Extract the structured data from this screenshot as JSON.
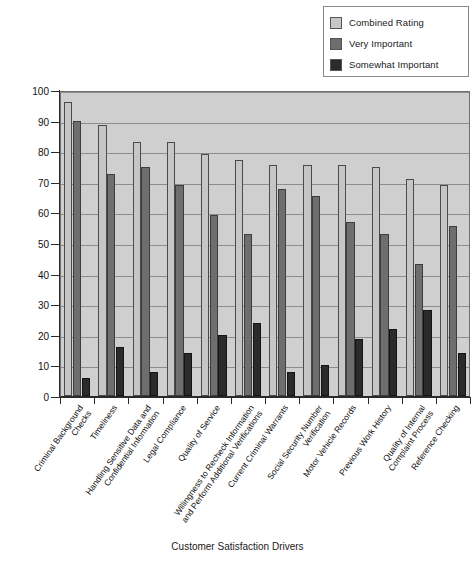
{
  "legend": {
    "position": "top-right",
    "items": [
      {
        "label": "Combined Rating",
        "color": "#c6c6c6",
        "swatch_name": "legend-swatch-combined-rating"
      },
      {
        "label": "Very Important",
        "color": "#6e6e6e",
        "swatch_name": "legend-swatch-very-important"
      },
      {
        "label": "Somewhat Important",
        "color": "#2b2b2b",
        "swatch_name": "legend-swatch-somewhat-important"
      }
    ]
  },
  "axes": {
    "y_ticks": [
      "100",
      "90",
      "80",
      "70",
      "60",
      "50",
      "40",
      "30",
      "20",
      "10",
      "0"
    ],
    "x_title": "Customer Satisfaction Drivers"
  },
  "chart_data": {
    "type": "bar",
    "title": "",
    "subtitle": "",
    "xlabel": "Customer Satisfaction Drivers",
    "ylabel": "",
    "ylim": [
      0,
      100
    ],
    "ytick_step": 10,
    "grid": true,
    "legend_position": "top-right",
    "plot_background": "#cfcfcf",
    "categories": [
      "Criminal Background Checks",
      "Timeliness",
      "Handling Sensitive Data and Confidential Information",
      "Legal Compliance",
      "Quality of  Service",
      "Willingness to Recheck Information and Perform Additional Verifications",
      "Current Criminal Warrants",
      "Social Security Number Verification",
      "Motor Vehicle Records",
      "Previous Work History",
      "Quality of Internal Complaint Process",
      "Reference Checking"
    ],
    "category_lines": [
      [
        "Criminal Background",
        "Checks"
      ],
      [
        "Timeliness"
      ],
      [
        "Handling Sensitive Data and",
        "Confidential Information"
      ],
      [
        "Legal Compliance"
      ],
      [
        "Quality of  Service"
      ],
      [
        "Willingness to Recheck Information",
        "and Perform Additional Verifications"
      ],
      [
        "Current Criminal Warrants"
      ],
      [
        "Social Security Number",
        "Verification"
      ],
      [
        "Motor Vehicle Records"
      ],
      [
        "Previous Work History"
      ],
      [
        "Quality of Internal",
        "Complaint Process"
      ],
      [
        "Reference Checking"
      ]
    ],
    "series": [
      {
        "name": "Combined Rating",
        "color": "#c6c6c6",
        "values": [
          96,
          88.5,
          83,
          83,
          79,
          77,
          75.5,
          75.5,
          75.5,
          75,
          71,
          69
        ]
      },
      {
        "name": "Very Important",
        "color": "#6e6e6e",
        "values": [
          90,
          72.5,
          75,
          69,
          59,
          53,
          67.5,
          65.5,
          57,
          53,
          43,
          55.5
        ]
      },
      {
        "name": "Somewhat Important",
        "color": "#2b2b2b",
        "values": [
          6,
          16,
          8,
          14,
          20,
          24,
          8,
          10,
          18.5,
          22,
          28,
          14
        ]
      }
    ]
  }
}
